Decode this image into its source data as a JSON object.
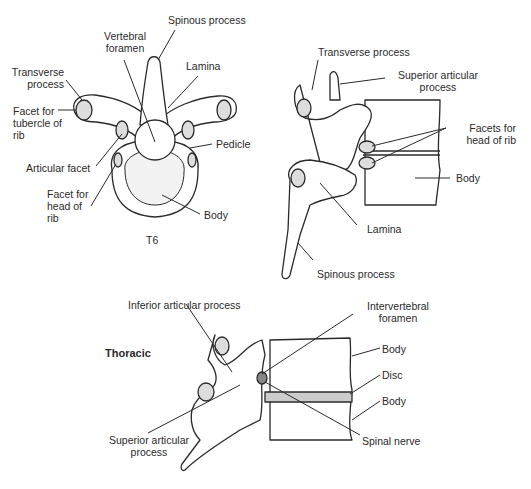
{
  "figure": {
    "top_left": {
      "caption": "T6",
      "labels": {
        "spinous_process": "Spinous process",
        "vertebral_foramen_1": "Vertebral",
        "vertebral_foramen_2": "foramen",
        "lamina": "Lamina",
        "transverse_process_1": "Transverse",
        "transverse_process_2": "process",
        "facet_tubercle_1": "Facet for",
        "facet_tubercle_2": "tubercle of",
        "facet_tubercle_3": "rib",
        "pedicle": "Pedicle",
        "articular_facet": "Articular facet",
        "facet_head_1": "Facet for",
        "facet_head_2": "head of",
        "facet_head_3": "rib",
        "body": "Body"
      }
    },
    "top_right": {
      "labels": {
        "transverse_process": "Transverse process",
        "superior_articular_1": "Superior articular",
        "superior_articular_2": "process",
        "facets_head_rib_1": "Facets for",
        "facets_head_rib_2": "head of rib",
        "body": "Body",
        "lamina": "Lamina",
        "spinous_process": "Spinous process"
      }
    },
    "bottom": {
      "title": "Thoracic",
      "labels": {
        "inferior_articular": "Inferior articular process",
        "intervertebral_foramen_1": "Intervertebral",
        "intervertebral_foramen_2": "foramen",
        "body_upper": "Body",
        "disc": "Disc",
        "body_lower": "Body",
        "superior_articular_1": "Superior articular",
        "superior_articular_2": "process",
        "spinal_nerve": "Spinal nerve"
      }
    }
  }
}
